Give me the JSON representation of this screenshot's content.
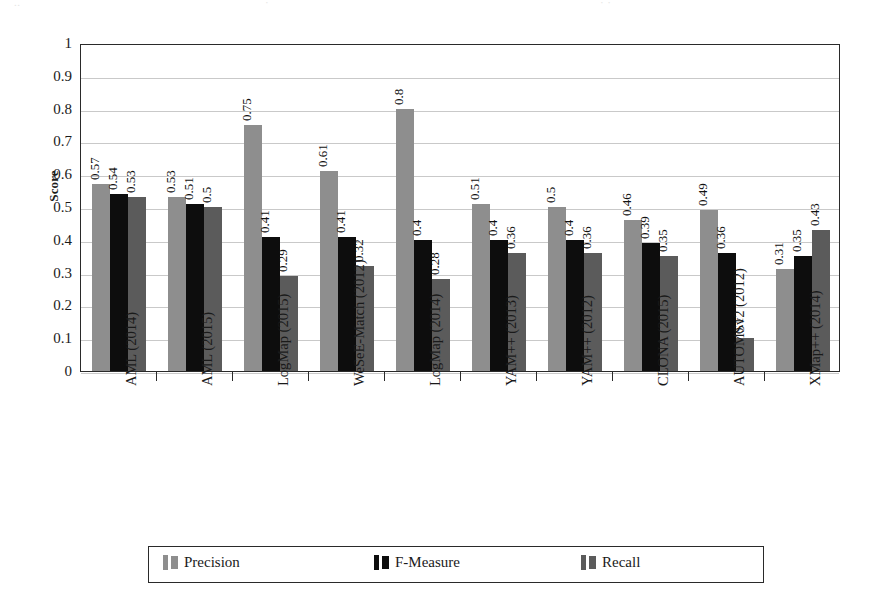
{
  "chart_data": {
    "type": "bar",
    "title": "",
    "xlabel": "",
    "ylabel": "Score",
    "ylim": [
      0,
      1
    ],
    "ytick_step": 0.1,
    "ytick_labels": [
      "1",
      "0.9",
      "0.8",
      "0.7",
      "0.6",
      "0.5",
      "0.4",
      "0.3",
      "0.2",
      "0.1",
      "0"
    ],
    "grid": true,
    "legend_position": "bottom",
    "categories": [
      "AML (2014)",
      "AML (2015)",
      "LogMap (2015)",
      "WeSeE-Match (2012)",
      "LogMap (2014)",
      "YAM++ (2013)",
      "YAM++ (2012)",
      "CLONA (2015)",
      "AUTOMSv2 (2012)",
      "XMap++ (2014)"
    ],
    "series": [
      {
        "name": "Precision",
        "color": "#8e8e8e",
        "values": [
          0.57,
          0.53,
          0.75,
          0.61,
          0.8,
          0.51,
          0.5,
          0.46,
          0.49,
          0.31
        ],
        "labels": [
          "0.57",
          "0.53",
          "0.75",
          "0.61",
          "0.8",
          "0.51",
          "0.5",
          "0.46",
          "0.49",
          "0.31"
        ]
      },
      {
        "name": "F-Measure",
        "color": "#0d0d0d",
        "values": [
          0.54,
          0.51,
          0.41,
          0.41,
          0.4,
          0.4,
          0.4,
          0.39,
          0.36,
          0.35
        ],
        "labels": [
          "0.54",
          "0.51",
          "0.41",
          "0.41",
          "0.4",
          "0.4",
          "0.4",
          "0.39",
          "0.36",
          "0.35"
        ]
      },
      {
        "name": "Recall",
        "color": "#5b5b5b",
        "values": [
          0.53,
          0.5,
          0.29,
          0.32,
          0.28,
          0.36,
          0.36,
          0.35,
          0.1,
          0.43
        ],
        "labels": [
          "0.53",
          "0.5",
          "0.29",
          "0.32",
          "0.28",
          "0.36",
          "0.36",
          "0.35",
          "0.1",
          "0.43"
        ]
      }
    ]
  },
  "axis": {
    "y_title": "Score"
  },
  "legend": {
    "items": [
      {
        "label": "Precision",
        "color": "#8e8e8e"
      },
      {
        "label": "F-Measure",
        "color": "#0d0d0d"
      },
      {
        "label": "Recall",
        "color": "#5b5b5b"
      }
    ]
  },
  "page_artifacts": {
    "top_crop_1": "..",
    "top_crop_2": "·",
    "top_crop_3": "· ·"
  }
}
